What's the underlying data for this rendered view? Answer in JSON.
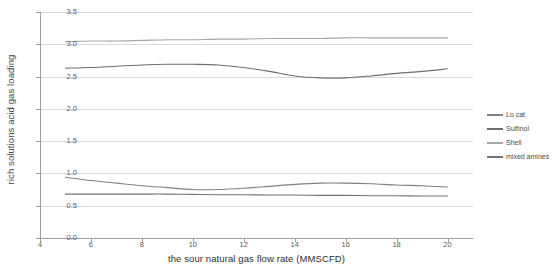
{
  "chart_data": {
    "type": "line",
    "title": "",
    "xlabel": "the sour natural gas flow rate (MMSCFD)",
    "ylabel": "rich solutions acid gas loading",
    "xlim": [
      4,
      21
    ],
    "ylim": [
      0.0,
      3.5
    ],
    "xticks": [
      4,
      6,
      8,
      10,
      12,
      14,
      16,
      18,
      20
    ],
    "xtick_labels": [
      "4",
      "6",
      "8",
      "10",
      "12",
      "14",
      "16",
      "18",
      "20"
    ],
    "yticks": [
      0.0,
      0.5,
      1.0,
      1.5,
      2.0,
      2.5,
      3.0,
      3.5
    ],
    "ytick_labels": [
      "0.0",
      "0.5",
      "1.0",
      "1.5",
      "2.0",
      "2.5",
      "3.0",
      "3.5"
    ],
    "grid": true,
    "legend_position": "right",
    "x": [
      5,
      6,
      7,
      8,
      9,
      10,
      11,
      12,
      13,
      14,
      15,
      16,
      17,
      18,
      19,
      20
    ],
    "series": [
      {
        "name": "Lo cat",
        "color": "#808080",
        "values": [
          0.94,
          0.89,
          0.85,
          0.81,
          0.78,
          0.75,
          0.75,
          0.77,
          0.8,
          0.83,
          0.85,
          0.85,
          0.84,
          0.82,
          0.81,
          0.79
        ]
      },
      {
        "name": "Sulfinol",
        "color": "#6e6e6e",
        "values": [
          2.63,
          2.64,
          2.66,
          2.68,
          2.69,
          2.69,
          2.68,
          2.64,
          2.58,
          2.51,
          2.48,
          2.48,
          2.51,
          2.55,
          2.58,
          2.62
        ]
      },
      {
        "name": "Shell",
        "color": "#a6a6a6",
        "values": [
          3.04,
          3.05,
          3.05,
          3.06,
          3.07,
          3.07,
          3.08,
          3.08,
          3.09,
          3.09,
          3.09,
          3.1,
          3.1,
          3.1,
          3.1,
          3.1
        ]
      },
      {
        "name": "mixed amines",
        "color": "#737373",
        "values": [
          0.68,
          0.68,
          0.68,
          0.68,
          0.68,
          0.675,
          0.67,
          0.67,
          0.665,
          0.665,
          0.66,
          0.66,
          0.655,
          0.655,
          0.65,
          0.65
        ]
      }
    ]
  },
  "legend": {
    "items": [
      {
        "label": "Lo cat"
      },
      {
        "label": "Sulfinol"
      },
      {
        "label": "Shell"
      },
      {
        "label": "mixed amines"
      }
    ]
  },
  "colors": {
    "gridline": "#d9d9d9",
    "axis": "#9e9e9e",
    "text": "#4a4a4a",
    "background": "#ffffff"
  }
}
